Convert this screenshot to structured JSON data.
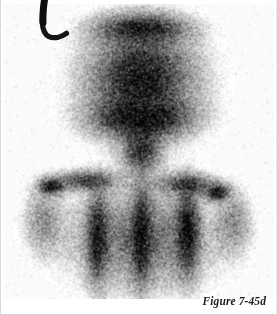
{
  "figure": {
    "caption": "Figure 7-45d",
    "modality_name": "scintigraphy-scan",
    "background_color": "#ffffff",
    "uptake_color": "#0d0d0d",
    "frame_border_color": "#d9d9d9"
  },
  "annotations": {
    "laterality_marker": {
      "label": "L",
      "name": "laterality-marker-left",
      "color": "#151515",
      "x": 30,
      "y": 0
    }
  },
  "scan": {
    "view": "anterior",
    "regions": [
      {
        "name": "skull-uptake",
        "cx": 140,
        "cy": 78,
        "rx": 62,
        "ry": 58,
        "intensity": 0.93
      },
      {
        "name": "skull-inferior-rim",
        "cx": 140,
        "cy": 118,
        "rx": 54,
        "ry": 22,
        "intensity": 1.0
      },
      {
        "name": "skull-vertex-rim",
        "cx": 140,
        "cy": 28,
        "rx": 50,
        "ry": 16,
        "intensity": 0.88
      },
      {
        "name": "neck-uptake",
        "cx": 140,
        "cy": 150,
        "rx": 22,
        "ry": 26,
        "intensity": 0.78
      },
      {
        "name": "left-shoulder-focus",
        "cx": 50,
        "cy": 186,
        "rx": 14,
        "ry": 9,
        "intensity": 1.0
      },
      {
        "name": "right-shoulder-focus",
        "cx": 216,
        "cy": 192,
        "rx": 13,
        "ry": 9,
        "intensity": 1.0
      },
      {
        "name": "left-clavicle",
        "cx": 85,
        "cy": 180,
        "rx": 34,
        "ry": 11,
        "intensity": 0.72
      },
      {
        "name": "right-clavicle",
        "cx": 186,
        "cy": 184,
        "rx": 32,
        "ry": 12,
        "intensity": 0.72
      },
      {
        "name": "spine-band",
        "cx": 140,
        "cy": 235,
        "rx": 11,
        "ry": 52,
        "intensity": 0.95
      },
      {
        "name": "left-paraspinal-band",
        "cx": 96,
        "cy": 238,
        "rx": 12,
        "ry": 50,
        "intensity": 0.9
      },
      {
        "name": "right-paraspinal-band",
        "cx": 186,
        "cy": 232,
        "rx": 13,
        "ry": 48,
        "intensity": 0.97
      },
      {
        "name": "thorax-soft-tissue",
        "cx": 140,
        "cy": 238,
        "rx": 80,
        "ry": 58,
        "intensity": 0.55
      },
      {
        "name": "left-arm",
        "cx": 42,
        "cy": 220,
        "rx": 22,
        "ry": 38,
        "intensity": 0.38
      },
      {
        "name": "right-arm",
        "cx": 232,
        "cy": 222,
        "rx": 20,
        "ry": 36,
        "intensity": 0.38
      }
    ]
  }
}
